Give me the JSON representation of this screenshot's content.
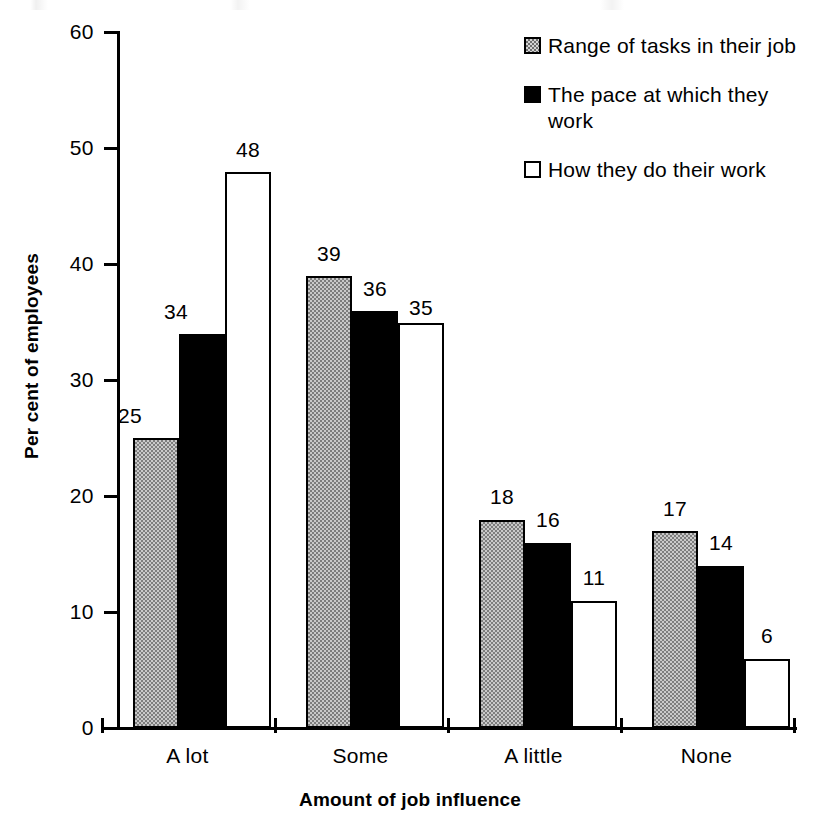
{
  "chart_data": {
    "type": "bar",
    "title": "",
    "subtitle": "",
    "xlabel": "Amount of job influence",
    "ylabel": "Per cent of employees",
    "categories": [
      "A lot",
      "Some",
      "A little",
      "None"
    ],
    "series": [
      {
        "name": "Range of tasks in their job",
        "values": [
          25,
          39,
          18,
          17
        ],
        "color": "#a0a0a0",
        "style": "gray-dither"
      },
      {
        "name": "The pace at which they work",
        "values": [
          34,
          36,
          16,
          14
        ],
        "color": "#000000",
        "style": "solid-black"
      },
      {
        "name": "How they do their work",
        "values": [
          48,
          35,
          11,
          6
        ],
        "color": "#ffffff",
        "style": "white-outline"
      }
    ],
    "ylim": [
      0,
      60
    ],
    "yticks": [
      0,
      10,
      20,
      30,
      40,
      50,
      60
    ],
    "ytick_labels": [
      "0",
      "10",
      "20",
      "30",
      "40",
      "50",
      "60"
    ],
    "grid": false,
    "legend_position": "top-right",
    "data_labels": true,
    "bar_group_gap": true,
    "bars_touching_within_group": true
  },
  "legend": {
    "items": [
      {
        "label": "Range of tasks in their job",
        "swatch": "legend-swatch-gray"
      },
      {
        "label": "The pace at which they work",
        "swatch": "legend-swatch-black"
      },
      {
        "label": "How they do their work",
        "swatch": "legend-swatch-white"
      }
    ]
  },
  "axes": {
    "y_title": "Per cent of employees",
    "x_title": "Amount of job influence",
    "y_ticks": [
      "60",
      "50",
      "40",
      "30",
      "20",
      "10",
      "0"
    ],
    "x_categories": [
      "A lot",
      "Some",
      "A little",
      "None"
    ]
  },
  "value_labels": {
    "a_lot": [
      "25",
      "34",
      "48"
    ],
    "some": [
      "39",
      "36",
      "35"
    ],
    "a_little": [
      "18",
      "16",
      "11"
    ],
    "none": [
      "17",
      "14",
      "6"
    ]
  }
}
